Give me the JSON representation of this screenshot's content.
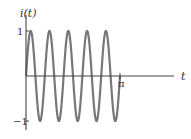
{
  "chart_data": {
    "type": "line",
    "title": "",
    "xlabel": "t",
    "ylabel": "i(t)",
    "function": "i(t) = sin(10t)",
    "x_range": [
      0,
      3.14159
    ],
    "ylim": [
      -1,
      1
    ],
    "x_ticks": [
      {
        "value": 3.14159,
        "label": "π"
      }
    ],
    "y_ticks": [
      {
        "value": 1,
        "label": "1"
      },
      {
        "value": -1,
        "label": "-1"
      }
    ],
    "periods": 5,
    "grid": false,
    "legend": null,
    "series": [
      {
        "name": "i(t)",
        "color": "#777777"
      }
    ]
  },
  "labels": {
    "y_axis": "i(t)",
    "x_axis": "t",
    "y_tick_pos": "1",
    "y_tick_neg": "−1",
    "x_tick_pi": "π"
  }
}
